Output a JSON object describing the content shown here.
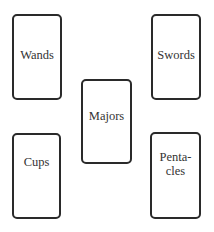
{
  "cards": [
    {
      "id": "wands",
      "label": "Wands",
      "x": 12,
      "y": 14,
      "w": 50,
      "h": 86,
      "label_top": 32
    },
    {
      "id": "swords",
      "label": "Swords",
      "x": 151,
      "y": 14,
      "w": 50,
      "h": 86,
      "label_top": 32
    },
    {
      "id": "majors",
      "label": "Majors",
      "x": 81,
      "y": 79,
      "w": 51,
      "h": 85,
      "label_top": 28
    },
    {
      "id": "cups",
      "label": "Cups",
      "x": 12,
      "y": 133,
      "w": 49,
      "h": 86,
      "label_top": 20
    },
    {
      "id": "pentacles",
      "label": "Penta-\ncles",
      "x": 150,
      "y": 132,
      "w": 51,
      "h": 87,
      "label_top": 16
    }
  ]
}
